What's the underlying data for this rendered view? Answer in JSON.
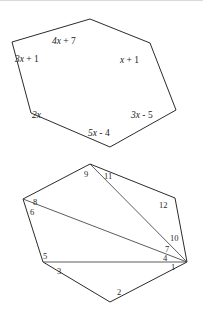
{
  "page": {
    "background_color": "#ffffff",
    "ink_color": "#2b2b2b",
    "width": 203,
    "height": 309
  },
  "figures": [
    {
      "id": "hexagon-with-expressions",
      "name": "Hexagon labeled with algebraic angle expressions",
      "shape": "hexagon",
      "vertices": [
        {
          "x": 90,
          "y": 19
        },
        {
          "x": 150,
          "y": 43
        },
        {
          "x": 176,
          "y": 110
        },
        {
          "x": 110,
          "y": 147
        },
        {
          "x": 31,
          "y": 113
        },
        {
          "x": 12,
          "y": 42
        }
      ],
      "labels": [
        {
          "id": "label-4x-plus-7",
          "text": "4x + 7",
          "var_part": "4x",
          "rest": " + 7",
          "x": 52,
          "y": 44
        },
        {
          "id": "label-3x-plus-1",
          "text": "3x + 1",
          "var_part": "3x",
          "rest": " + 1",
          "x": 15,
          "y": 62
        },
        {
          "id": "label-x-plus-1",
          "text": "x + 1",
          "var_part": "x",
          "rest": " + 1",
          "x": 120,
          "y": 63
        },
        {
          "id": "label-2x",
          "text": "2x",
          "var_part": "2x",
          "rest": "",
          "x": 32,
          "y": 118
        },
        {
          "id": "label-3x-minus-5",
          "text": "3x - 5",
          "var_part": "3x",
          "rest": " - 5",
          "x": 131,
          "y": 118
        },
        {
          "id": "label-5x-minus-4",
          "text": "5x - 4",
          "var_part": "5x",
          "rest": " - 4",
          "x": 88,
          "y": 136
        }
      ]
    },
    {
      "id": "polygon-with-numbered-angles",
      "name": "Hexagon divided by diagonals into triangles with numbered angles",
      "shape": "hexagon-triangulated",
      "vertices": [
        {
          "x": 90,
          "y": 12
        },
        {
          "x": 175,
          "y": 46
        },
        {
          "x": 187,
          "y": 110
        },
        {
          "x": 110,
          "y": 150
        },
        {
          "x": 43,
          "y": 110
        },
        {
          "x": 23,
          "y": 47
        }
      ],
      "diagonals": [
        {
          "id": "diagonal-top-to-right",
          "from": {
            "x": 90,
            "y": 12
          },
          "to": {
            "x": 187,
            "y": 110
          }
        },
        {
          "id": "diagonal-left-to-right",
          "from": {
            "x": 23,
            "y": 47
          },
          "to": {
            "x": 187,
            "y": 110
          }
        },
        {
          "id": "diagonal-lowerleft-to-right",
          "from": {
            "x": 43,
            "y": 110
          },
          "to": {
            "x": 187,
            "y": 110
          }
        }
      ],
      "angle_labels": [
        {
          "id": "angle-1",
          "text": "1",
          "x": 171,
          "y": 118
        },
        {
          "id": "angle-2",
          "text": "2",
          "x": 117,
          "y": 143
        },
        {
          "id": "angle-3",
          "text": "3",
          "x": 57,
          "y": 122
        },
        {
          "id": "angle-4",
          "text": "4",
          "x": 165,
          "y": 110
        },
        {
          "id": "angle-5",
          "text": "5",
          "x": 44,
          "y": 108
        },
        {
          "id": "angle-6",
          "text": "6",
          "x": 31,
          "y": 62
        },
        {
          "id": "angle-7",
          "text": "7",
          "x": 166,
          "y": 101
        },
        {
          "id": "angle-8",
          "text": "8",
          "x": 34,
          "y": 52
        },
        {
          "id": "angle-9",
          "text": "9",
          "x": 86,
          "y": 24
        },
        {
          "id": "angle-10",
          "text": "10",
          "x": 172,
          "y": 88
        },
        {
          "id": "angle-11",
          "text": "11",
          "x": 106,
          "y": 26
        },
        {
          "id": "angle-12",
          "text": "12",
          "x": 161,
          "y": 55
        }
      ]
    }
  ]
}
